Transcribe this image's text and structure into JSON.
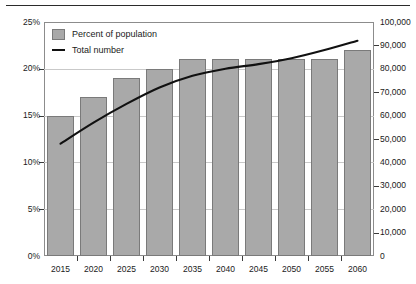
{
  "chart_data": {
    "type": "bar",
    "title": "",
    "xlabel": "",
    "ylabel": "",
    "grid": true,
    "legend_position": "top-left",
    "categories": [
      "2015",
      "2020",
      "2025",
      "2030",
      "2035",
      "2040",
      "2045",
      "2050",
      "2055",
      "2060"
    ],
    "series": [
      {
        "name": "Percent of population",
        "type": "bar",
        "axis": "left",
        "values": [
          15,
          17,
          19,
          20,
          21,
          21,
          21,
          21,
          21,
          22
        ],
        "color": "#a9a9a9"
      },
      {
        "name": "Total number",
        "type": "line",
        "axis": "right",
        "values": [
          48000,
          57000,
          65000,
          72000,
          77000,
          80000,
          82000,
          84500,
          88000,
          92000
        ],
        "color": "#111111"
      }
    ],
    "left_axis": {
      "ylim": [
        0,
        25
      ],
      "ticks": [
        0,
        5,
        10,
        15,
        20,
        25
      ],
      "tick_labels": [
        "0%",
        "5%",
        "10%",
        "15%",
        "20%",
        "25%"
      ]
    },
    "right_axis": {
      "ylim": [
        0,
        100000
      ],
      "ticks": [
        0,
        10000,
        20000,
        30000,
        40000,
        50000,
        60000,
        70000,
        80000,
        90000,
        100000
      ],
      "tick_labels": [
        "0",
        "10,000",
        "20,000",
        "30,000",
        "40,000",
        "50,000",
        "60,000",
        "70,000",
        "80,000",
        "90,000",
        "100,000"
      ]
    }
  },
  "legend": {
    "items": [
      {
        "label": "Percent of population",
        "marker": "swatch"
      },
      {
        "label": "Total number",
        "marker": "line"
      }
    ]
  }
}
